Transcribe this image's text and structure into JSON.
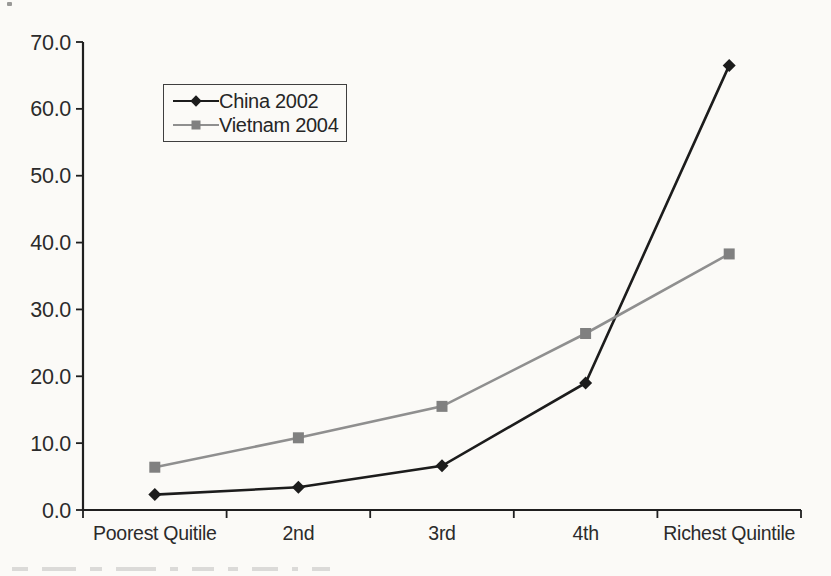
{
  "chart_data": {
    "type": "line",
    "title": "",
    "xlabel": "",
    "ylabel": "",
    "categories": [
      "Poorest Quitile",
      "2nd",
      "3rd",
      "4th",
      "Richest Quintile"
    ],
    "series": [
      {
        "name": "China 2002",
        "marker": "diamond",
        "line_color": "#1c1c1c",
        "marker_color": "#1c1c1c",
        "values": [
          2.3,
          3.4,
          6.6,
          19.0,
          66.5
        ]
      },
      {
        "name": "Vietnam 2004",
        "marker": "square",
        "line_color": "#8f8f8f",
        "marker_color": "#808080",
        "values": [
          6.4,
          10.8,
          15.5,
          26.4,
          38.3
        ]
      }
    ],
    "ylim": [
      0,
      70
    ],
    "ytick_step": 10,
    "ytick_labels": [
      "0.0",
      "10.0",
      "20.0",
      "30.0",
      "40.0",
      "50.0",
      "60.0",
      "70.0"
    ],
    "grid": false,
    "legend": {
      "position": "upper-left-inside",
      "entries": [
        "China 2002",
        "Vietnam 2004"
      ]
    }
  },
  "colors": {
    "axis": "#1f1f1f",
    "text": "#2b2b2b",
    "background": "#fbfaf7",
    "legend_border": "#3f3f3f"
  }
}
